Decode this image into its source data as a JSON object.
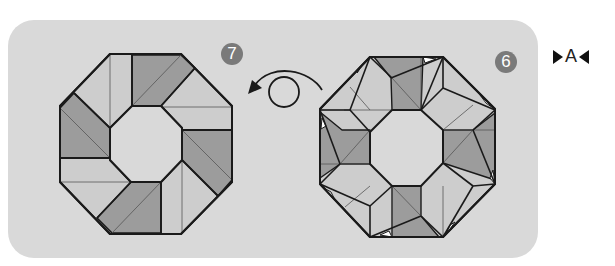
{
  "diagram": {
    "type": "origami-step-diagram",
    "section_label": "A",
    "steps": [
      {
        "number": "7",
        "description": "Finished octagonal ring (result after turning over)"
      },
      {
        "number": "6",
        "description": "Octagonal ring with folded units, before turning over"
      }
    ],
    "arrow": {
      "type": "turn-over",
      "direction": "right-to-left"
    },
    "colors": {
      "panel": "#d9d9d9",
      "dark_face": "#9a9a9a",
      "light_face": "#cfcfcf",
      "badge": "#7a7a7a",
      "outline": "#1a1a1a"
    }
  }
}
